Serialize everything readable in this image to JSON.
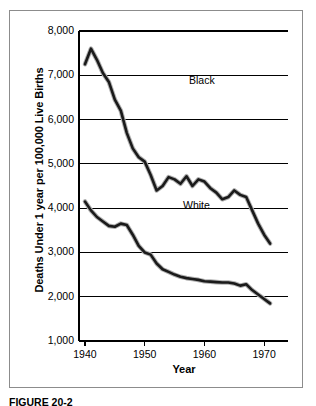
{
  "figure": {
    "caption": "FIGURE 20-2"
  },
  "chart_data": {
    "type": "line",
    "title": "",
    "xlabel": "Year",
    "ylabel": "Deaths Under 1 year per 100,000 Live Births",
    "xlim": [
      1939,
      1974
    ],
    "ylim": [
      1000,
      8000
    ],
    "grid": true,
    "legend_position": "inline-annotation",
    "y_ticks": [
      "1,000",
      "2,000",
      "3,000",
      "4,000",
      "5,000",
      "6,000",
      "7,000",
      "8,000"
    ],
    "y_tick_values": [
      1000,
      2000,
      3000,
      4000,
      5000,
      6000,
      7000,
      8000
    ],
    "x_ticks": [
      "1940",
      "1950",
      "1960",
      "1970"
    ],
    "x_tick_values": [
      1940,
      1950,
      1960,
      1970
    ],
    "series": [
      {
        "name": "Black",
        "color": "#1a1a1a",
        "x": [
          1940,
          1941,
          1942,
          1943,
          1944,
          1945,
          1946,
          1947,
          1948,
          1949,
          1950,
          1951,
          1952,
          1953,
          1954,
          1955,
          1956,
          1957,
          1958,
          1959,
          1960,
          1961,
          1962,
          1963,
          1964,
          1965,
          1966,
          1967,
          1968,
          1969,
          1970,
          1971
        ],
        "values": [
          7250,
          7600,
          7350,
          7050,
          6850,
          6450,
          6200,
          5700,
          5350,
          5150,
          5050,
          4750,
          4400,
          4500,
          4700,
          4650,
          4550,
          4720,
          4500,
          4650,
          4600,
          4450,
          4350,
          4200,
          4250,
          4400,
          4300,
          4250,
          3950,
          3650,
          3400,
          3200
        ]
      },
      {
        "name": "White",
        "color": "#1a1a1a",
        "x": [
          1940,
          1941,
          1942,
          1943,
          1944,
          1945,
          1946,
          1947,
          1948,
          1949,
          1950,
          1951,
          1952,
          1953,
          1954,
          1955,
          1956,
          1957,
          1958,
          1959,
          1960,
          1961,
          1962,
          1963,
          1964,
          1965,
          1966,
          1967,
          1968,
          1969,
          1970,
          1971
        ],
        "values": [
          4150,
          3950,
          3800,
          3700,
          3600,
          3580,
          3650,
          3620,
          3400,
          3150,
          3000,
          2950,
          2750,
          2620,
          2560,
          2500,
          2450,
          2420,
          2400,
          2380,
          2350,
          2340,
          2330,
          2320,
          2320,
          2300,
          2250,
          2280,
          2150,
          2050,
          1950,
          1850
        ]
      }
    ],
    "annotations": [
      {
        "text": "Black",
        "x": 1957,
        "y": 5350
      },
      {
        "text": "White",
        "x": 1956,
        "y": 2700
      }
    ]
  }
}
